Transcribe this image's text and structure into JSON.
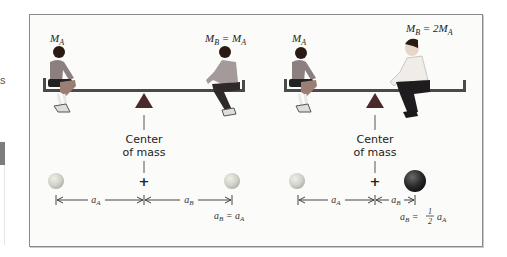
{
  "edge": {
    "partial_text": "s"
  },
  "figure": {
    "left_panel": {
      "label_kid_a": "M",
      "label_kid_a_sub": "A",
      "label_kid_b": "M",
      "label_kid_b_sub": "B",
      "label_kid_b_eq": " = M",
      "label_kid_b_eq_sub": "A",
      "com_label_line1": "Center",
      "com_label_line2": "of mass",
      "plus_symbol": "+",
      "dist_a": "a",
      "dist_a_sub": "A",
      "dist_b": "a",
      "dist_b_sub": "B",
      "relation": "a",
      "relation_sub": "B",
      "relation_eq": " = a",
      "relation_eq_sub": "A"
    },
    "right_panel": {
      "label_kid_a": "M",
      "label_kid_a_sub": "A",
      "label_kid_b": "M",
      "label_kid_b_sub": "B",
      "label_kid_b_eq": " = 2M",
      "label_kid_b_eq_sub": "A",
      "com_label_line1": "Center",
      "com_label_line2": "of mass",
      "plus_symbol": "+",
      "dist_a": "a",
      "dist_a_sub": "A",
      "dist_b": "a",
      "dist_b_sub": "B",
      "relation": "a",
      "relation_sub": "B",
      "relation_eq": " = ",
      "relation_frac_num": "1",
      "relation_frac_den": "2",
      "relation_tail": "a",
      "relation_tail_sub": "A"
    },
    "colors": {
      "fulcrum": "#4b2a2b",
      "beam": "#4a4a4a",
      "light_sphere": "#cfcfc9",
      "heavy_sphere": "#2a2a2a",
      "border": "#8a8a8a"
    }
  }
}
